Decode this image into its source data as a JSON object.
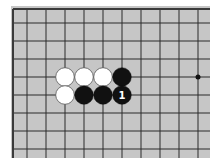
{
  "board": {
    "background": "#c6c6c6",
    "line_color": "#2a2a2a",
    "edge_color": "#3a3a3a",
    "region": {
      "x": 11,
      "y": 6,
      "w": 199,
      "h": 152
    },
    "edges": {
      "left_x": 13,
      "top_y": 9
    },
    "columns_x": [
      27,
      46,
      65,
      84,
      103,
      122,
      141,
      160,
      179,
      198
    ],
    "rows_y": [
      23,
      41,
      59,
      77,
      95,
      113,
      131,
      149
    ],
    "star_points": [
      {
        "col": 9,
        "row": 3
      }
    ]
  },
  "stones": [
    {
      "color": "white",
      "col": 2,
      "row": 3,
      "label": ""
    },
    {
      "color": "white",
      "col": 3,
      "row": 3,
      "label": ""
    },
    {
      "color": "white",
      "col": 4,
      "row": 3,
      "label": ""
    },
    {
      "color": "black",
      "col": 5,
      "row": 3,
      "label": ""
    },
    {
      "color": "white",
      "col": 2,
      "row": 4,
      "label": ""
    },
    {
      "color": "black",
      "col": 3,
      "row": 4,
      "label": ""
    },
    {
      "color": "black",
      "col": 4,
      "row": 4,
      "label": ""
    },
    {
      "color": "black",
      "col": 5,
      "row": 4,
      "label": "1"
    }
  ],
  "stone_colors": {
    "black": "#111111",
    "white": "#ffffff",
    "white_border": "#555555",
    "label_on_black": "#ffffff"
  }
}
